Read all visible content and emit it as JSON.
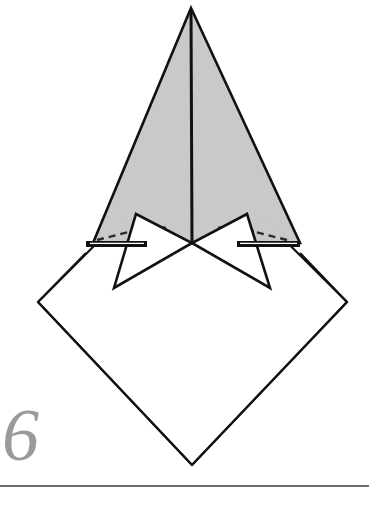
{
  "page": {
    "kind": "origami-instruction-diagram",
    "width": 369,
    "height": 505,
    "background_color": "#ffffff"
  },
  "step": {
    "number": "6",
    "number_color": "#9a9a9a"
  },
  "footer": {
    "rule_color": "#6e6e72"
  },
  "palette": {
    "paper_front": "#ffffff",
    "paper_back_shaded": "#c9c9c9",
    "outline": "#111111",
    "crease_fold": "#2b2b2b",
    "hidden_edge": "#3a3a3a"
  },
  "figure": {
    "base_diamond": {
      "name": "square-base-diamond",
      "fill": "#ffffff",
      "stroke": "#111111",
      "stroke_width": 2.2,
      "points": "38,302 192,148 347,302 192,465"
    },
    "shaded_kite": {
      "name": "shaded-upper-kite",
      "fill": "#c9c9c9",
      "stroke": "#111111",
      "stroke_width": 2.6,
      "points": "191,8 300,243 191,243 93,243"
    },
    "shaded_left_half": {
      "name": "shaded-kite-left-half",
      "fill": "#c9c9c9",
      "points": "191,8 191,243 93,243"
    },
    "shaded_right_half": {
      "name": "shaded-kite-right-half",
      "fill": "#c9c9c9",
      "points": "191,8 300,243 191,243"
    },
    "center_spine": {
      "name": "center-vertical-crease",
      "stroke": "#111111",
      "stroke_width": 3.0,
      "x1": 191,
      "y1": 10,
      "x2": 192,
      "y2": 243
    },
    "left_flap": {
      "name": "left-white-flap",
      "fill": "#ffffff",
      "stroke": "#111111",
      "stroke_width": 2.6,
      "points": "136,214 192,243 114,288"
    },
    "right_flap": {
      "name": "right-white-flap",
      "fill": "#ffffff",
      "stroke": "#111111",
      "stroke_width": 2.6,
      "points": "247,214 192,243 270,288"
    },
    "left_flap_inner_edge": {
      "name": "left-flap-inner-edge",
      "stroke": "#111111",
      "stroke_width": 2.4,
      "x1": 136,
      "y1": 214,
      "x2": 114,
      "y2": 288
    },
    "right_flap_inner_edge": {
      "name": "right-flap-inner-edge",
      "stroke": "#111111",
      "stroke_width": 2.4,
      "x1": 247,
      "y1": 214,
      "x2": 270,
      "y2": 288
    },
    "left_thick_bar": {
      "name": "left-raw-edge-bar",
      "stroke": "#111111",
      "stroke_width": 6.0,
      "x1": 86,
      "y1": 244,
      "x2": 146,
      "y2": 244
    },
    "left_thick_bar_highlight": {
      "name": "left-raw-edge-bar-highlight",
      "stroke": "#ffffff",
      "stroke_width": 1.3,
      "x1": 90,
      "y1": 243.5,
      "x2": 144,
      "y2": 243.5
    },
    "right_thick_bar": {
      "name": "right-raw-edge-bar",
      "stroke": "#111111",
      "stroke_width": 6.0,
      "x1": 238,
      "y1": 244,
      "x2": 299,
      "y2": 244
    },
    "right_thick_bar_highlight": {
      "name": "right-raw-edge-bar-highlight",
      "stroke": "#ffffff",
      "stroke_width": 1.3,
      "x1": 240,
      "y1": 243.5,
      "x2": 296,
      "y2": 243.5
    },
    "left_dashed_fold": {
      "name": "left-valley-fold-dashed-line",
      "stroke": "#2b2b2b",
      "stroke_width": 2.4,
      "dash": "7 5",
      "x1": 97,
      "y1": 240,
      "x2": 152,
      "y2": 226
    },
    "right_dashed_fold": {
      "name": "right-valley-fold-dashed-line",
      "stroke": "#2b2b2b",
      "stroke_width": 2.4,
      "dash": "7 5",
      "x1": 287,
      "y1": 240,
      "x2": 232,
      "y2": 226
    },
    "left_dotted_hidden": {
      "name": "left-hidden-edge-dotted-line",
      "stroke": "#2b2b2b",
      "stroke_width": 2.3,
      "dash": "2 6",
      "x1": 131,
      "y1": 231,
      "x2": 166,
      "y2": 227
    },
    "right_dotted_hidden": {
      "name": "right-hidden-edge-dotted-line",
      "stroke": "#2b2b2b",
      "stroke_width": 2.3,
      "dash": "2 6",
      "x1": 253,
      "y1": 231,
      "x2": 218,
      "y2": 227
    },
    "left_shade_sliver": {
      "name": "left-shaded-sliver-under-flap",
      "fill": "#c9c9c9",
      "points": "93,243 136,214 146,243"
    },
    "right_shade_sliver": {
      "name": "right-shaded-sliver-under-flap",
      "fill": "#c9c9c9",
      "points": "300,243 247,214 238,243"
    }
  }
}
